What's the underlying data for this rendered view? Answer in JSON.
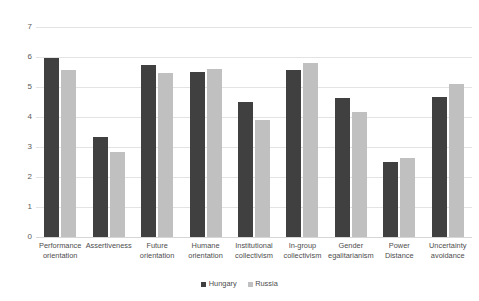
{
  "chart_data": {
    "type": "bar",
    "title": "",
    "xlabel": "",
    "ylabel": "",
    "ylim": [
      0,
      7
    ],
    "yticks": [
      0,
      1,
      2,
      3,
      4,
      5,
      6,
      7
    ],
    "grid": true,
    "legend_position": "bottom",
    "categories": [
      "Performance orientation",
      "Assertiveness",
      "Future orientation",
      "Humane orientation",
      "Institutional collectivism",
      "In-group collectivism",
      "Gender egalitarianism",
      "Power Distance",
      "Uncertainty avoidance"
    ],
    "category_lines": [
      [
        "Performance",
        "orientation"
      ],
      [
        "Assertiveness",
        ""
      ],
      [
        "Future",
        "orientation"
      ],
      [
        "Humane",
        "orientation"
      ],
      [
        "Institutional",
        "collectivism"
      ],
      [
        "In-group",
        "collectivism"
      ],
      [
        "Gender",
        "egalitarianism"
      ],
      [
        "Power Distance",
        ""
      ],
      [
        "Uncertainty",
        "avoidance"
      ]
    ],
    "series": [
      {
        "name": "Hungary",
        "color": "#404040",
        "values": [
          5.97,
          3.33,
          5.73,
          5.5,
          4.5,
          5.57,
          4.63,
          2.49,
          4.68
        ]
      },
      {
        "name": "Russia",
        "color": "#c0c0c0",
        "values": [
          5.56,
          2.82,
          5.48,
          5.6,
          3.89,
          5.8,
          4.17,
          2.63,
          5.1
        ]
      }
    ]
  },
  "legend": {
    "items": [
      {
        "label": "Hungary"
      },
      {
        "label": "Russia"
      }
    ]
  }
}
